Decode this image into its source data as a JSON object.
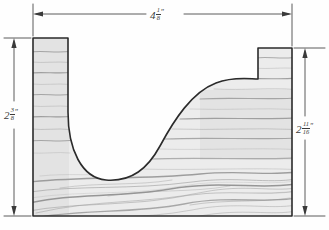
{
  "drawing": {
    "type": "technical-sketch",
    "subject": "wood board cross-section with U-shaped cutout",
    "style": "hand-drawn pencil sketch with wood grain shading",
    "colors": {
      "paper": "#fefefe",
      "outline": "#2b2b2b",
      "wood_fill": "#ececec",
      "grain_dark": "#8d8d8d",
      "grain_light": "#b8b8b8",
      "dimension_line": "#4a4a4a",
      "label_text": "#3a3a3a"
    },
    "dimensions": [
      {
        "id": "overall-width",
        "orientation": "horizontal",
        "position": "top",
        "whole": "4",
        "numerator": "1",
        "denominator": "8",
        "unit": "″",
        "value_text": "4 1/8\""
      },
      {
        "id": "left-height",
        "orientation": "vertical",
        "position": "left",
        "whole": "2",
        "numerator": "3",
        "denominator": "8",
        "unit": "″",
        "value_text": "2 3/8\""
      },
      {
        "id": "right-height",
        "orientation": "vertical",
        "position": "right",
        "whole": "2",
        "numerator": "11",
        "denominator": "16",
        "unit": "″",
        "value_text": "2 11/16\""
      }
    ]
  }
}
